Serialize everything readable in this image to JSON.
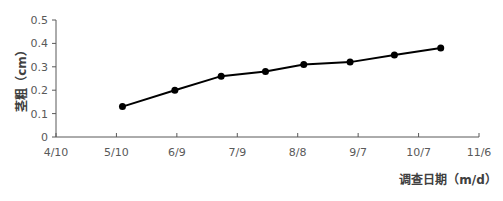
{
  "chart_data": {
    "type": "line",
    "title": "",
    "xlabel": "调查日期（m/d）",
    "ylabel": "茎粗（cm）",
    "x_tick_labels": [
      "4/10",
      "5/10",
      "6/9",
      "7/9",
      "8/8",
      "9/7",
      "10/7",
      "11/6"
    ],
    "y_tick_labels": [
      "0",
      "0.1",
      "0.2",
      "0.3",
      "0.4",
      "0.5"
    ],
    "ylim": [
      0,
      0.5
    ],
    "xlim": [
      "4/10",
      "11/6"
    ],
    "grid": false,
    "legend": null,
    "series": [
      {
        "name": "茎粗",
        "color": "#000000",
        "marker": "circle",
        "x": [
          "5/13",
          "6/8",
          "7/1",
          "7/23",
          "8/11",
          "9/3",
          "9/25",
          "10/18"
        ],
        "x_days_from_start": [
          33,
          59,
          82,
          104,
          123,
          146,
          168,
          191
        ],
        "values": [
          0.13,
          0.2,
          0.26,
          0.28,
          0.31,
          0.32,
          0.35,
          0.38
        ]
      }
    ]
  },
  "axes": {
    "x_title": "调查日期（m/d）",
    "y_title": "茎粗（cm）"
  }
}
